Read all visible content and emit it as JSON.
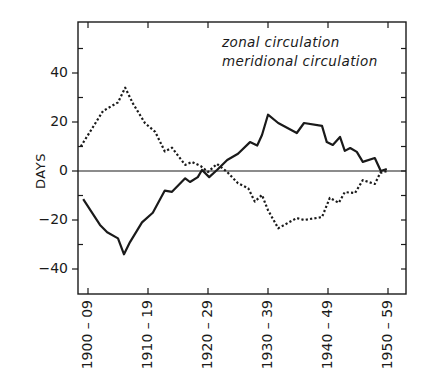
{
  "chart_data": {
    "type": "line",
    "title": "",
    "xlabel": "",
    "ylabel": "DAYS",
    "ylim": [
      -50,
      60
    ],
    "xlim": [
      1904,
      1957
    ],
    "grid": false,
    "zero_line": true,
    "legend_position": "upper right",
    "y_ticks": [
      40,
      20,
      0,
      -20,
      -40
    ],
    "y_tick_labels": [
      "40",
      "20",
      "0",
      "-20",
      "-40"
    ],
    "y_minor_ticks": [
      50,
      30,
      10,
      -10,
      -30
    ],
    "x_tick_positions": [
      1905,
      1915,
      1925,
      1935,
      1945,
      1955
    ],
    "x_tick_labels": [
      "1900-09",
      "1910-19",
      "1920-29",
      "1930-39",
      "1940-49",
      "1950-59"
    ],
    "series": [
      {
        "name": "zonal circulation",
        "style": "solid",
        "x": [
          1904.2,
          1907,
          1908.2,
          1910,
          1911,
          1912,
          1914,
          1915.8,
          1917.8,
          1919,
          1921.2,
          1922,
          1923.3,
          1924,
          1925.2,
          1926.5,
          1928.2,
          1930,
          1932,
          1933.2,
          1934,
          1935,
          1936.7,
          1939.8,
          1941,
          1944,
          1944.8,
          1945.8,
          1947,
          1947.8,
          1948.7,
          1949.8,
          1950.8,
          1952.8,
          1953.8,
          1954.8
        ],
        "values": [
          -11.5,
          -22,
          -25,
          -27.5,
          -34,
          -29,
          -21,
          -17,
          -8,
          -8.5,
          -3,
          -4.5,
          -2.5,
          0.4,
          -2.5,
          0.4,
          4.5,
          7,
          11.8,
          10.4,
          14.7,
          23,
          19.6,
          15.5,
          19.6,
          18.4,
          11.8,
          10.6,
          13.9,
          8.2,
          9.4,
          7.8,
          3.7,
          5.3,
          0,
          0.8
        ]
      },
      {
        "name": "meridional circulation",
        "style": "dashed",
        "x": [
          1903.8,
          1907.5,
          1910,
          1911.2,
          1912.5,
          1914.5,
          1916.2,
          1917.8,
          1919,
          1921.2,
          1922.3,
          1923.8,
          1925,
          1926.5,
          1928.2,
          1930,
          1931.7,
          1932.8,
          1934,
          1935,
          1936.7,
          1939.8,
          1941,
          1944,
          1945.3,
          1946.8,
          1947.8,
          1949.5,
          1950.8,
          1952.8,
          1953.7,
          1954.8
        ],
        "values": [
          10,
          24.5,
          28,
          34,
          27.5,
          19.5,
          16,
          8,
          9.5,
          2.5,
          3.7,
          2,
          -0.4,
          2.9,
          -0.4,
          -5,
          -7,
          -12.5,
          -9.8,
          -16,
          -23.4,
          -19.2,
          -20,
          -18.8,
          -11,
          -13,
          -8.6,
          -9,
          -3.7,
          -5.3,
          -0.8,
          0
        ]
      }
    ]
  },
  "legend": {
    "zonal_label": "zonal circulation",
    "meridional_label": "meridional circulation"
  },
  "colors": {
    "line": "#1a1a1a",
    "background": "#ffffff"
  }
}
